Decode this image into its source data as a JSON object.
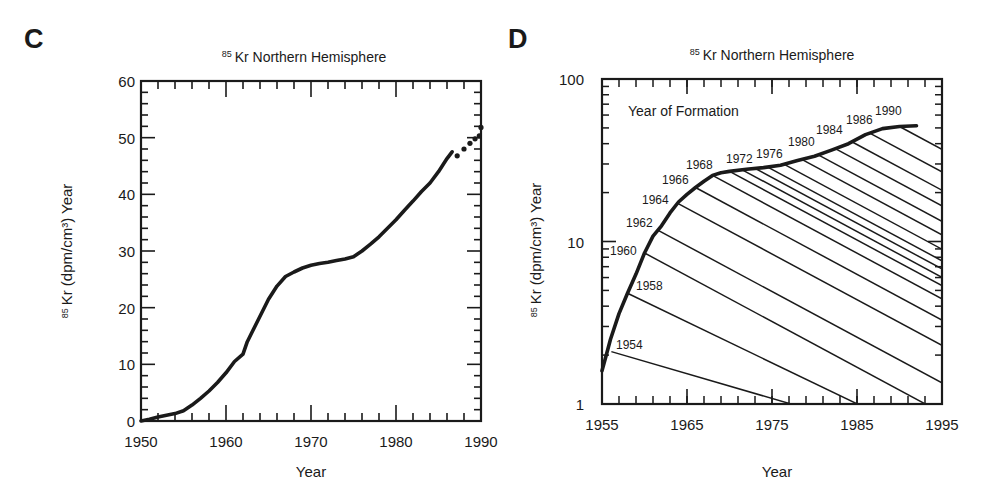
{
  "figure": {
    "panels": [
      "C",
      "D"
    ]
  },
  "chart_data": [
    {
      "panel": "C",
      "type": "line",
      "title_sup": "85",
      "title": "Kr Northern Hemisphere",
      "xlabel": "Year",
      "ylabel_sup": "85",
      "ylabel": "Kr (dpm/cm³) Year",
      "xlim": [
        1950,
        1990
      ],
      "ylim": [
        0,
        60
      ],
      "xticks": [
        1950,
        1960,
        1970,
        1980,
        1990
      ],
      "yticks": [
        0,
        10,
        20,
        30,
        40,
        50,
        60
      ],
      "grid": false,
      "series": [
        {
          "name": "85Kr Northern Hemisphere (curve)",
          "style": "solid",
          "x": [
            1950,
            1951,
            1952,
            1953,
            1954,
            1955,
            1956,
            1957,
            1958,
            1959,
            1960,
            1961,
            1962,
            1962.5,
            1963,
            1964,
            1965,
            1966,
            1967,
            1968,
            1969,
            1970,
            1971,
            1972,
            1973,
            1974,
            1975,
            1976,
            1977,
            1978,
            1979,
            1980,
            1981,
            1982,
            1983,
            1984,
            1985,
            1986,
            1986.6
          ],
          "values": [
            0,
            0.3,
            0.7,
            1.0,
            1.3,
            1.8,
            2.8,
            4.0,
            5.3,
            6.8,
            8.5,
            10.5,
            11.8,
            14.0,
            15.5,
            18.5,
            21.5,
            23.8,
            25.5,
            26.3,
            27.0,
            27.5,
            27.8,
            28.0,
            28.3,
            28.6,
            29.0,
            30.0,
            31.2,
            32.5,
            34.0,
            35.5,
            37.2,
            38.8,
            40.5,
            42.0,
            44.0,
            46.3,
            47.5
          ]
        },
        {
          "name": "85Kr Northern Hemisphere (projected points)",
          "style": "dots",
          "x": [
            1987.2,
            1988.0,
            1988.7,
            1989.3,
            1989.8,
            1990.0
          ],
          "values": [
            46.8,
            48.0,
            49.0,
            49.8,
            50.3,
            51.8
          ]
        }
      ]
    },
    {
      "panel": "D",
      "type": "line",
      "title_sup": "85",
      "title": "Kr Northern Hemisphere",
      "xlabel": "Year",
      "ylabel_sup": "85",
      "ylabel": "Kr (dpm/cm³) Year",
      "yscale": "log",
      "xlim": [
        1955,
        1995
      ],
      "ylim": [
        1,
        100
      ],
      "xticks": [
        1955,
        1965,
        1975,
        1985,
        1995
      ],
      "yticks": [
        1,
        10,
        100
      ],
      "ytick_labels": [
        "1",
        "10",
        "100"
      ],
      "grid": false,
      "annotation": "Year of Formation",
      "series": [
        {
          "name": "85Kr Northern Hemisphere (curve)",
          "style": "solid-thick",
          "x": [
            1955,
            1955.5,
            1956,
            1957,
            1958,
            1959,
            1960,
            1961,
            1962,
            1963,
            1964,
            1965,
            1966,
            1967,
            1968,
            1969,
            1970,
            1972,
            1974,
            1976,
            1978,
            1980,
            1982,
            1984,
            1986,
            1988,
            1990,
            1992
          ],
          "values": [
            1.6,
            2.0,
            2.5,
            3.6,
            4.8,
            6.3,
            8.5,
            10.8,
            12.5,
            15.0,
            17.5,
            19.5,
            21.5,
            23.5,
            25.5,
            26.5,
            27.0,
            27.8,
            28.5,
            29.5,
            31.5,
            33.5,
            36.5,
            40.0,
            45.5,
            49.5,
            51.0,
            51.5
          ]
        }
      ],
      "decay_lines": {
        "description": "Decay lines from year of formation (85Kr half-life 10.7 yr)",
        "half_life_years": 10.7,
        "labeled_years": [
          1954,
          1958,
          1960,
          1962,
          1964,
          1966,
          1968,
          1972,
          1976,
          1980,
          1984,
          1986,
          1990
        ],
        "origins": [
          {
            "year": 1956.1,
            "value": 2.1,
            "label": "1954"
          },
          {
            "year": 1958.0,
            "value": 4.8,
            "label": "1958"
          },
          {
            "year": 1960.0,
            "value": 8.5,
            "label": "1960"
          },
          {
            "year": 1961.5,
            "value": 11.8,
            "label": "1962"
          },
          {
            "year": 1963.8,
            "value": 17.3,
            "label": "1964"
          },
          {
            "year": 1966.0,
            "value": 21.5,
            "label": "1966"
          },
          {
            "year": 1968.0,
            "value": 25.5,
            "label": "1968"
          },
          {
            "year": 1970.0,
            "value": 27.0,
            "label": ""
          },
          {
            "year": 1971.5,
            "value": 27.6,
            "label": "1972"
          },
          {
            "year": 1973.0,
            "value": 28.2,
            "label": ""
          },
          {
            "year": 1974.5,
            "value": 28.7,
            "label": "1976"
          },
          {
            "year": 1976.5,
            "value": 29.7,
            "label": ""
          },
          {
            "year": 1978.5,
            "value": 32.0,
            "label": "1980"
          },
          {
            "year": 1980.5,
            "value": 34.0,
            "label": ""
          },
          {
            "year": 1982.5,
            "value": 37.2,
            "label": "1984"
          },
          {
            "year": 1984.5,
            "value": 40.8,
            "label": ""
          },
          {
            "year": 1986.5,
            "value": 46.5,
            "label": "1986"
          },
          {
            "year": 1990.0,
            "value": 51.0,
            "label": "1990"
          }
        ]
      }
    }
  ]
}
